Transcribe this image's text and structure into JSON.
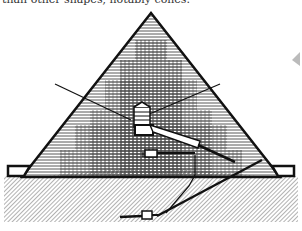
{
  "caption": {
    "text": "than other shapes, notably cones."
  },
  "figure": {
    "elements": [
      "pyramid-body",
      "king-chamber",
      "relieving-chambers",
      "grand-gallery",
      "queen-chamber",
      "ascending-passage",
      "descending-passage",
      "subterranean-chamber",
      "air-shafts",
      "casing-base-blocks",
      "bedrock"
    ],
    "colors": {
      "ink": "#111111",
      "paper": "#ffffff",
      "hatch": "#555555"
    }
  }
}
